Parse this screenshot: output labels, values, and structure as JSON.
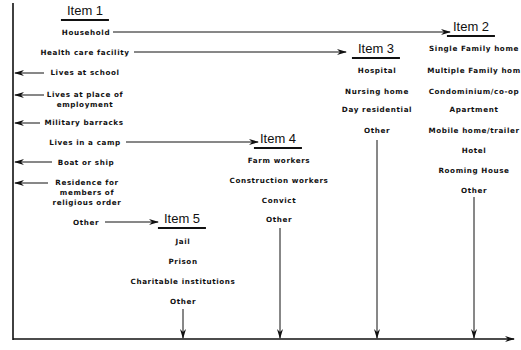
{
  "diagram": {
    "items": [
      {
        "id": "item1",
        "title": "Item 1",
        "options": [
          "Household",
          "Health care facility",
          "Lives at school",
          "Lives at place of employment",
          "Military barracks",
          "Lives in a camp",
          "Boat or ship",
          "Residence for members of religious order",
          "Other"
        ]
      },
      {
        "id": "item2",
        "title": "Item 2",
        "options": [
          "Single Family home",
          "Multiple Family hom",
          "Condominium/co-op",
          "Apartment",
          "Mobile home/trailer",
          "Hotel",
          "Rooming House",
          "Other"
        ]
      },
      {
        "id": "item3",
        "title": "Item 3",
        "options": [
          "Hospital",
          "Nursing home",
          "Day residential",
          "Other"
        ]
      },
      {
        "id": "item4",
        "title": "Item 4",
        "options": [
          "Farm workers",
          "Construction workers",
          "Convict",
          "Other"
        ]
      },
      {
        "id": "item5",
        "title": "Item 5",
        "options": [
          "Jail",
          "Prison",
          "Charitable institutions",
          "Other"
        ]
      }
    ],
    "item1_labels": {
      "household": "Household",
      "health": "Health care facility",
      "school": "Lives at school",
      "employment_1": "Lives at place of",
      "employment_2": "employment",
      "military": "Military barracks",
      "camp": "Lives in a camp",
      "boat": "Boat or ship",
      "religious_1": "Residence for",
      "religious_2": "members of",
      "religious_3": "religious order",
      "other": "Other"
    },
    "flows": [
      {
        "from": "Household",
        "to": "Item 2"
      },
      {
        "from": "Health care facility",
        "to": "Item 3"
      },
      {
        "from": "Lives in a camp",
        "to": "Item 4"
      },
      {
        "from": "Other",
        "to": "Item 5"
      },
      {
        "from": "Lives at school",
        "to": "left axis"
      },
      {
        "from": "Lives at place of employment",
        "to": "left axis"
      },
      {
        "from": "Military barracks",
        "to": "left axis"
      },
      {
        "from": "Boat or ship",
        "to": "left axis"
      },
      {
        "from": "Residence for members of religious order",
        "to": "left axis"
      },
      {
        "from": "Item 2 Other",
        "to": "bottom axis"
      },
      {
        "from": "Item 3 Other",
        "to": "bottom axis"
      },
      {
        "from": "Item 4 Other",
        "to": "bottom axis"
      },
      {
        "from": "Item 5 Other",
        "to": "bottom axis"
      }
    ]
  }
}
